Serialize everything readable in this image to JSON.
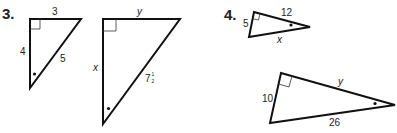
{
  "problems": [
    {
      "number": "3.",
      "triangles": [
        {
          "labels": {
            "top": "3",
            "left": "4",
            "hypotenuse": "5"
          }
        },
        {
          "labels": {
            "top": "y",
            "left": "x",
            "hypotenuse_whole": "7",
            "hypotenuse_frac_num": "1",
            "hypotenuse_frac_den": "2"
          }
        }
      ]
    },
    {
      "number": "4.",
      "triangles": [
        {
          "labels": {
            "short_leg": "5",
            "long_leg": "12",
            "hypotenuse": "x"
          }
        },
        {
          "labels": {
            "short_leg": "10",
            "long_leg": "y",
            "hypotenuse": "26"
          }
        }
      ]
    }
  ]
}
